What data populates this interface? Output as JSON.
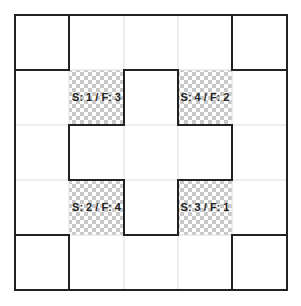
{
  "diagram": {
    "grid": {
      "rows": 5,
      "cols": 5
    },
    "colors": {
      "background": "#ffffff",
      "grid_line": "#dddddd",
      "outline": "#222222",
      "checker_light": "#ffffff",
      "checker_dark": "#c8c8c8"
    },
    "corner_squares": [
      "top-left",
      "top-right",
      "bottom-left",
      "bottom-right"
    ],
    "center_shape": "plus",
    "cells": [
      {
        "row": 1,
        "col": 1,
        "label": "S: 1 / F: 3"
      },
      {
        "row": 1,
        "col": 3,
        "label": "S: 4 / F: 2"
      },
      {
        "row": 3,
        "col": 1,
        "label": "S: 2 / F: 4"
      },
      {
        "row": 3,
        "col": 3,
        "label": "S: 3 / F: 1"
      }
    ]
  }
}
